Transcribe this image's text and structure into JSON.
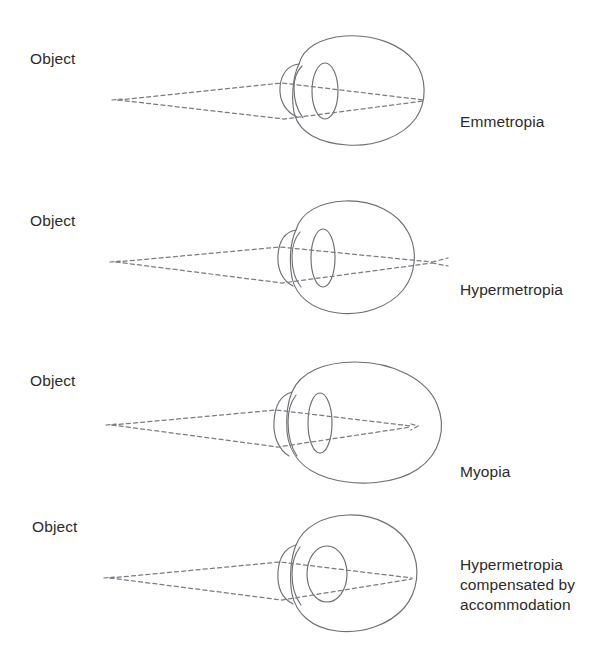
{
  "figure": {
    "background_color": "#ffffff",
    "line_color": "#6f6f74",
    "ray_color": "#7b7b84",
    "text_color": "#2b2b2b"
  },
  "panels": [
    {
      "id": "emmetropia",
      "object_label": "Object",
      "condition_label": "Emmetropia",
      "focus_description": "rays converge exactly on the retina",
      "eye_shape": "normal-round",
      "lens_shape": "narrow-ellipse",
      "focal_point_x": 424,
      "retina_x": 424
    },
    {
      "id": "hypermetropia",
      "object_label": "Object",
      "condition_label": "Hypermetropia",
      "focus_description": "rays converge behind the retina",
      "eye_shape": "short-round",
      "lens_shape": "narrow-ellipse",
      "focal_point_x": 432,
      "retina_x": 408
    },
    {
      "id": "myopia",
      "object_label": "Object",
      "condition_label": "Myopia",
      "focus_description": "rays converge in front of the retina",
      "eye_shape": "elongated-oval",
      "lens_shape": "narrow-ellipse",
      "focal_point_x": 411,
      "retina_x": 437
    },
    {
      "id": "hypermetropia-accommodated",
      "object_label": "Object",
      "condition_label": "Hypermetropia\ncompensated by\naccommodation",
      "focus_description": "thickened lens brings rays onto the retina",
      "eye_shape": "short-round",
      "lens_shape": "thick-round",
      "focal_point_x": 412,
      "retina_x": 412
    }
  ]
}
